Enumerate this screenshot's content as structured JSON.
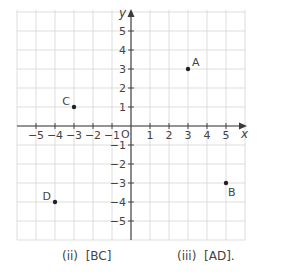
{
  "chart_data": {
    "type": "scatter",
    "title": "",
    "xlabel": "x",
    "ylabel": "y",
    "origin_label": "O",
    "xlim": [
      -6,
      6
    ],
    "ylim": [
      -6,
      6
    ],
    "grid": true,
    "x_ticks": [
      -5,
      -4,
      -3,
      -2,
      -1,
      1,
      2,
      3,
      4,
      5
    ],
    "y_ticks": [
      -5,
      -4,
      -3,
      -2,
      -1,
      1,
      2,
      3,
      4,
      5
    ],
    "x_tick_labels": [
      "−5",
      "−4",
      "−3",
      "−2",
      "−1",
      "1",
      "2",
      "3",
      "4",
      "5"
    ],
    "y_tick_labels": [
      "−5",
      "−4",
      "−3",
      "−2",
      "−1",
      "1",
      "2",
      "3",
      "4",
      "5"
    ],
    "points": [
      {
        "label": "A",
        "x": 3,
        "y": 3
      },
      {
        "label": "B",
        "x": 5,
        "y": -3
      },
      {
        "label": "C",
        "x": -3,
        "y": 1
      },
      {
        "label": "D",
        "x": -4,
        "y": -4
      }
    ]
  },
  "captions": {
    "ii": "(ii)  [BC]",
    "iii": "(iii)  [AD]."
  }
}
